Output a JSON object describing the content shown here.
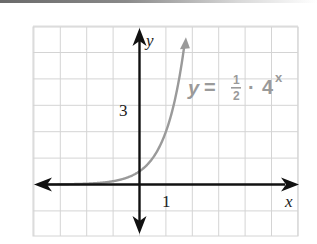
{
  "chart_data": {
    "type": "line",
    "title": "",
    "xlabel": "x",
    "ylabel": "y",
    "xlim": [
      -4,
      6
    ],
    "ylim": [
      -2,
      6
    ],
    "grid": true,
    "x_tick_labels": [
      {
        "value": 1,
        "label": "1"
      }
    ],
    "y_tick_labels": [
      {
        "value": 3,
        "label": "3"
      }
    ],
    "series": [
      {
        "name": "y = 1/2 · 4^x",
        "function": "0.5 * 4^x",
        "color": "#9a9a9a",
        "x": [
          -4,
          -3,
          -2,
          -1,
          0,
          0.5,
          1,
          1.5,
          1.72
        ],
        "y": [
          0.002,
          0.008,
          0.031,
          0.125,
          0.5,
          1,
          2,
          4,
          5.45
        ]
      }
    ],
    "annotation": {
      "lhs": "y",
      "equals": "=",
      "numerator": "1",
      "denominator": "2",
      "dot": "·",
      "base": "4",
      "exponent": "x"
    },
    "colors": {
      "axis": "#111111",
      "grid": "#d4d4d4",
      "curve": "#9a9a9a",
      "label": "#222222"
    }
  }
}
